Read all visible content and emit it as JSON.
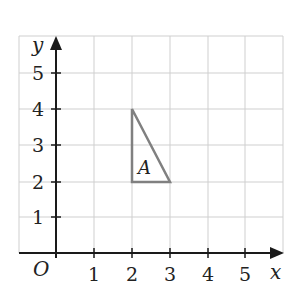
{
  "axes": {
    "x_label": "x",
    "y_label": "y",
    "origin_label": "O",
    "x_ticks": [
      "1",
      "2",
      "3",
      "4",
      "5"
    ],
    "y_ticks": [
      "1",
      "2",
      "3",
      "4",
      "5"
    ],
    "x_range": [
      0,
      6
    ],
    "y_range": [
      0,
      6
    ]
  },
  "shape": {
    "label": "A",
    "type": "triangle",
    "vertices": [
      [
        2,
        4
      ],
      [
        2,
        2
      ],
      [
        3,
        2
      ]
    ],
    "stroke_color": "#808080"
  },
  "colors": {
    "grid": "#cfcfcf",
    "axis": "#1a1a1a",
    "shape": "#808080"
  }
}
